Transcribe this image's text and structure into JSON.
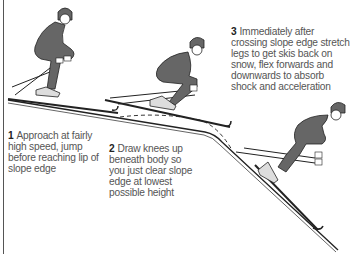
{
  "diagram": {
    "colors": {
      "figure_fill": "#666666",
      "outline": "#222222",
      "text": "#555555",
      "background": "#ffffff"
    },
    "steps": [
      {
        "number": "1",
        "text": "Approach at fairly high speed, jump before reaching lip of slope edge"
      },
      {
        "number": "2",
        "text": "Draw knees up beneath body so you just clear slope edge at lowest possible height"
      },
      {
        "number": "3",
        "text": "Immediately after crossing slope edge stretch legs to get skis back on snow, flex forwards and downwards to absorb shock and acceleration"
      }
    ],
    "elements": {
      "slope": "slope-profile-line",
      "trajectory": "dashed-flight-path",
      "figures": [
        "skier-approach",
        "skier-tuck",
        "skier-landing"
      ]
    }
  }
}
